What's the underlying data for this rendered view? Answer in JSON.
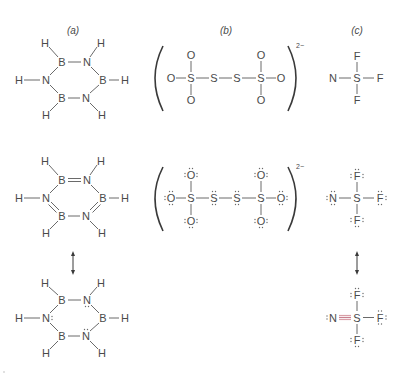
{
  "figure": {
    "panels": [
      {
        "label": "(a)",
        "title": "borazine",
        "structures": [
          {
            "name": "skeleton",
            "atoms": [
              "H",
              "H",
              "B",
              "N",
              "H",
              "N",
              "B",
              "H",
              "B",
              "N",
              "H",
              "H"
            ]
          },
          {
            "name": "resonance-double-bonds",
            "atoms": [
              "H",
              "H",
              "B",
              "N",
              "H",
              "N",
              "B",
              "H",
              "B",
              "N",
              "H",
              "H"
            ]
          },
          {
            "name": "resonance-lone-pairs",
            "atoms": [
              "H",
              "H",
              "B",
              "N",
              "H",
              "N",
              "B",
              "H",
              "B",
              "N",
              "H",
              "H"
            ]
          }
        ]
      },
      {
        "label": "(b)",
        "title": "tetrathionate ion",
        "charge": "2−",
        "structures": [
          {
            "name": "skeleton",
            "atoms": [
              "O",
              "S",
              "S",
              "S",
              "S",
              "O",
              "O",
              "O",
              "O",
              "O"
            ]
          },
          {
            "name": "lewis",
            "atoms": [
              "O",
              "S",
              "S",
              "S",
              "S",
              "O",
              "O",
              "O",
              "O",
              "O"
            ]
          }
        ]
      },
      {
        "label": "(c)",
        "title": "NSF3",
        "structures": [
          {
            "name": "skeleton",
            "atoms": [
              "N",
              "S",
              "F",
              "F",
              "F"
            ]
          },
          {
            "name": "lewis-single",
            "atoms": [
              "N",
              "S",
              "F",
              "F",
              "F"
            ]
          },
          {
            "name": "lewis-triple",
            "atoms": [
              "N",
              "S",
              "F",
              "F",
              "F"
            ]
          }
        ]
      }
    ],
    "colors": {
      "text": "#4a4a4a",
      "bond": "#6a6a6a",
      "highlight_bond": "#d9a0a8"
    }
  }
}
